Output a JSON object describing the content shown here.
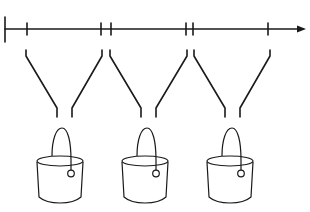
{
  "diagram": {
    "type": "timeline-funnels-buckets",
    "colors": {
      "stroke": "#1a1a1a",
      "background": "#ffffff"
    },
    "timeline": {
      "y": 29,
      "x_start": 5,
      "x_end": 305,
      "arrow": true,
      "start_cap_x": 5,
      "ticks_x": [
        27,
        101,
        111,
        186,
        193,
        268
      ]
    },
    "intervals": [
      {
        "name": "interval-1",
        "start_x": 27,
        "end_x": 101
      },
      {
        "name": "interval-2",
        "start_x": 111,
        "end_x": 186
      },
      {
        "name": "interval-3",
        "start_x": 193,
        "end_x": 268
      }
    ],
    "funnels": [
      {
        "name": "funnel-1",
        "top_left_x": 26,
        "top_right_x": 102,
        "spout_left_x": 57,
        "spout_right_x": 72
      },
      {
        "name": "funnel-2",
        "top_left_x": 110,
        "top_right_x": 187,
        "spout_left_x": 141,
        "spout_right_x": 156
      },
      {
        "name": "funnel-3",
        "top_left_x": 194,
        "top_right_x": 270,
        "spout_left_x": 225,
        "spout_right_x": 240
      }
    ],
    "buckets": [
      {
        "name": "bucket-1",
        "center_x": 60
      },
      {
        "name": "bucket-2",
        "center_x": 145
      },
      {
        "name": "bucket-3",
        "center_x": 230
      }
    ]
  }
}
